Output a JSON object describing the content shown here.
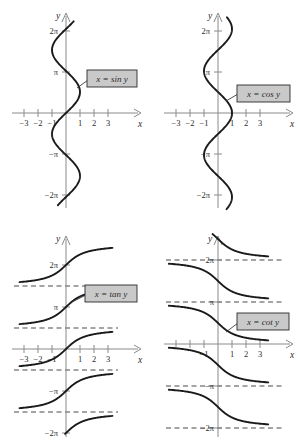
{
  "figure": {
    "width": 304,
    "height": 444,
    "background": "#ffffff",
    "curve_color": "#1a1a1a",
    "axis_color": "#8a8a8a",
    "asymptote_color": "#4a4a4a",
    "callout_fill": "#c9c9c9",
    "callout_border": "#2b2b2b"
  },
  "panels": [
    {
      "id": "sin",
      "label": "x = sin y",
      "y_axis_name": "y",
      "x_axis_name": "x",
      "x_ticks": [
        -3,
        -2,
        -1,
        1,
        2,
        3
      ],
      "x_tick_labels": [
        "−3",
        "−2",
        "−1",
        "1",
        "2",
        "3"
      ],
      "y_ticks": [
        "2π",
        "π",
        "−π",
        "−2π"
      ],
      "y_tick_values": [
        6.283185,
        3.141593,
        -3.141593,
        -6.283185
      ],
      "has_asymptotes": false,
      "description": "Reflection of y = sin x about the line y = x; sinusoid oscillating horizontally between x = -1 and x = 1 for y from -2pi to 2pi."
    },
    {
      "id": "cos",
      "label": "x = cos y",
      "y_axis_name": "y",
      "x_axis_name": "x",
      "x_ticks": [
        -3,
        -2,
        -1,
        1,
        2,
        3
      ],
      "x_tick_labels": [
        "−3",
        "−2",
        "−1",
        "1",
        "2",
        "3"
      ],
      "y_ticks": [
        "2π",
        "π",
        "−π",
        "−2π"
      ],
      "y_tick_values": [
        6.283185,
        3.141593,
        -3.141593,
        -6.283185
      ],
      "has_asymptotes": false,
      "description": "Reflection of y = cos x about the line y = x; cosinusoid oscillating horizontally between x = -1 and x = 1 for y from -2pi to 2pi."
    },
    {
      "id": "tan",
      "label": "x = tan y",
      "y_axis_name": "y",
      "x_axis_name": "x",
      "x_ticks": [
        -3,
        -2,
        -1,
        1,
        2,
        3
      ],
      "x_tick_labels": [
        "−3",
        "−2",
        "−1",
        "1",
        "2",
        "3"
      ],
      "y_ticks": [
        "2π",
        "π",
        "−π",
        "−2π"
      ],
      "y_tick_values": [
        6.283185,
        3.141593,
        -3.141593,
        -6.283185
      ],
      "has_asymptotes": true,
      "asymptotes": [
        7.853982,
        4.712389,
        1.570796,
        -1.570796,
        -4.712389,
        -7.853982
      ],
      "asymptote_note": "horizontal dashed lines at y = (2k+1)pi/2",
      "description": "Reflection of y = tan x about the line y = x; increasing branches between consecutive horizontal asymptotes."
    },
    {
      "id": "cot",
      "label": "x = cot y",
      "y_axis_name": "y",
      "x_axis_name": "x",
      "x_ticks": [
        -3,
        -2,
        -1,
        1,
        2,
        3
      ],
      "x_tick_labels": [
        "",
        "",
        "−1",
        "1",
        "2",
        "3"
      ],
      "y_ticks": [
        "2π",
        "π",
        "−π",
        "−2π"
      ],
      "y_tick_values": [
        6.283185,
        3.141593,
        -3.141593,
        -6.283185
      ],
      "has_asymptotes": true,
      "asymptotes": [
        6.283185,
        3.141593,
        0,
        -3.141593,
        -6.283185
      ],
      "asymptote_note": "horizontal dashed lines at y = k*pi",
      "description": "Reflection of y = cot x about the line y = x; decreasing branches between consecutive horizontal asymptotes."
    }
  ],
  "chart_data": {
    "type": "line",
    "xlabel": "x",
    "ylabel": "y",
    "xlim": [
      -3.6,
      3.6
    ],
    "ylim": [
      -7.6,
      7.6
    ],
    "grid": false,
    "legend": "inline callout labels",
    "series": [
      {
        "name": "x = sin y",
        "panel": "sin",
        "relation": "x = sin(y)",
        "x_range": [
          -1,
          1
        ],
        "y_range": [
          -6.283185,
          6.283185
        ]
      },
      {
        "name": "x = cos y",
        "panel": "cos",
        "relation": "x = cos(y)",
        "x_range": [
          -1,
          1
        ],
        "y_range": [
          -6.283185,
          6.283185
        ]
      },
      {
        "name": "x = tan y",
        "panel": "tan",
        "relation": "x = tan(y)",
        "x_range": [
          -3.4,
          3.4
        ],
        "y_range": [
          -7.853982,
          7.853982
        ],
        "asymptotes_y": [
          7.853982,
          4.712389,
          1.570796,
          -1.570796,
          -4.712389,
          -7.853982
        ]
      },
      {
        "name": "x = cot y",
        "panel": "cot",
        "relation": "x = cot(y)",
        "x_range": [
          -3.4,
          3.4
        ],
        "y_range": [
          -7.2,
          7.2
        ],
        "asymptotes_y": [
          6.283185,
          3.141593,
          0,
          -3.141593,
          -6.283185
        ]
      }
    ]
  }
}
